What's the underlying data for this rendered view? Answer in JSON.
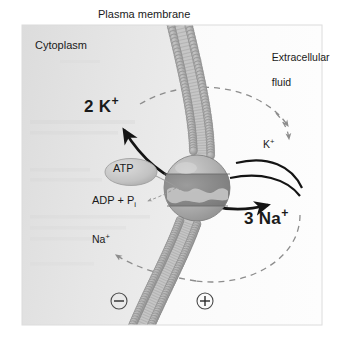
{
  "figure": {
    "canvas": {
      "width": 344,
      "height": 342
    },
    "panel": {
      "x": 22,
      "y": 25,
      "width": 300,
      "height": 300,
      "cytoplasm_fill": "#e3e3e3",
      "extracellular_fill": "#fcfcfc",
      "border_color": "#d8d8d8"
    }
  },
  "labels": {
    "plasma_membrane": "Plasma membrane",
    "cytoplasm": "Cytoplasm",
    "extracellular_line1": "Extracellular",
    "extracellular_line2": "fluid",
    "potassium_bold_count": "2",
    "potassium_bold_symbol": "K",
    "potassium_bold_charge": "+",
    "sodium_bold_count": "3",
    "sodium_bold_symbol": "Na",
    "sodium_bold_charge": "+",
    "potassium_small_symbol": "K",
    "potassium_small_charge": "+",
    "sodium_small_symbol": "Na",
    "sodium_small_charge": "+",
    "atp": "ATP",
    "adp_main": "ADP + P",
    "adp_subscript": "i",
    "charge_negative": "−",
    "charge_positive": "+"
  },
  "colors": {
    "membrane_head": "#a8a8a8",
    "membrane_head_stroke": "#8f8f8f",
    "membrane_tail": "#b9b9b9",
    "transporter_light": "#b2b2b2",
    "transporter_dark": "#8a8a8a",
    "transporter_stroke": "#6d6d6d",
    "atp_ellipse_fill": "#c9c9c9",
    "atp_ellipse_stroke": "#a0a0a0",
    "arrow_solid": "#141414",
    "arrow_dashed": "#8d8d8d",
    "text": "#1a1a1a"
  },
  "elements": {
    "membrane": {
      "name": "phospholipid-bilayer",
      "description": "Curved lipid bilayer with spherical head groups and tails, bulging toward extracellular fluid"
    },
    "transporter": {
      "name": "na-k-atpase-pump-protein",
      "description": "Spherical membrane transport protein with horizontal band and wavy central channel",
      "center_x": 197,
      "center_y": 188,
      "radius": 33
    },
    "arrows": [
      {
        "name": "potassium-influx-arrow",
        "style": "solid",
        "from": "transporter",
        "to": "2 K+ (cytoplasm)",
        "direction": "up-left"
      },
      {
        "name": "sodium-efflux-arrow",
        "style": "solid",
        "from": "transporter",
        "to": "3 Na+ (extracellular fluid)",
        "direction": "down-right"
      },
      {
        "name": "potassium-gradient-arrow",
        "style": "dashed",
        "from": "cytoplasm",
        "to": "K+ (extracellular fluid)",
        "direction": "clockwise-right"
      },
      {
        "name": "sodium-gradient-arrow",
        "style": "dashed",
        "from": "extracellular fluid",
        "to": "Na+ (cytoplasm)",
        "direction": "counterclockwise-left"
      },
      {
        "name": "atp-hydrolysis-arrow",
        "style": "thin-solid",
        "from": "ATP",
        "to": "transporter binding site"
      },
      {
        "name": "adp-release-arrow",
        "style": "thin-dashed",
        "from": "transporter",
        "to": "ADP + Pi"
      }
    ],
    "charges": [
      {
        "name": "membrane-potential-negative",
        "symbol": "−",
        "side": "cytoplasm",
        "x": 119,
        "y": 301
      },
      {
        "name": "membrane-potential-positive",
        "symbol": "+",
        "side": "extracellular",
        "x": 205,
        "y": 301
      }
    ]
  }
}
